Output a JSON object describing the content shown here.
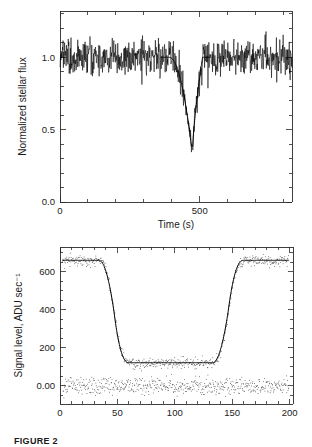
{
  "figure": {
    "caption_label": "FIGURE 2"
  },
  "chart_data": [
    {
      "id": "top-panel",
      "type": "line",
      "title": "",
      "xlabel": "Time (s)",
      "ylabel": "Normalized stellar flux",
      "xlim": [
        0,
        830
      ],
      "ylim": [
        0.0,
        1.32
      ],
      "xticks": [
        0,
        500
      ],
      "xticklabels": [
        "0",
        "500"
      ],
      "xminor_step": 100,
      "yticks": [
        0.0,
        0.5,
        1.0
      ],
      "yticklabels": [
        "0.0",
        "0.5",
        "1.0"
      ],
      "yminor_step": 0.1,
      "grid": false,
      "legend": null,
      "series": [
        {
          "name": "Normalized stellar flux",
          "style": "noisy-line",
          "baseline": 1.0,
          "noise_sigma": 0.062,
          "n_points": 760,
          "occultation": {
            "ingress_start": 390,
            "ingress_end": 470,
            "egress_start": 475,
            "egress_end": 510,
            "min_depth": 0.385
          }
        }
      ]
    },
    {
      "id": "bottom-panel",
      "type": "scatter",
      "title": "",
      "xlabel": "Seconds after 10:35:50 UTC",
      "ylabel": "Signal level, ADU sec⁻¹",
      "xlim": [
        0,
        203
      ],
      "ylim": [
        -95,
        730
      ],
      "xticks": [
        0,
        50,
        100,
        150,
        200
      ],
      "xticklabels": [
        "0",
        "50",
        "100",
        "150",
        "200"
      ],
      "xminor_step": 10,
      "yticks": [
        0,
        200,
        400,
        600
      ],
      "yticklabels": [
        "0.00",
        "200",
        "400",
        "600"
      ],
      "yminor_step": 50,
      "grid": false,
      "legend": null,
      "series": [
        {
          "name": "Signal level",
          "style": "scatter+fit",
          "out_of_occultation_level": 660,
          "in_occultation_level": 122,
          "noise_sigma": 14,
          "n_points": 560,
          "occultation": {
            "ingress_start": 34,
            "ingress_end": 60,
            "egress_start": 133,
            "egress_end": 160
          }
        },
        {
          "name": "Residuals",
          "style": "scatter",
          "level": 0,
          "noise_sigma": 22,
          "n_points": 560
        }
      ]
    }
  ]
}
